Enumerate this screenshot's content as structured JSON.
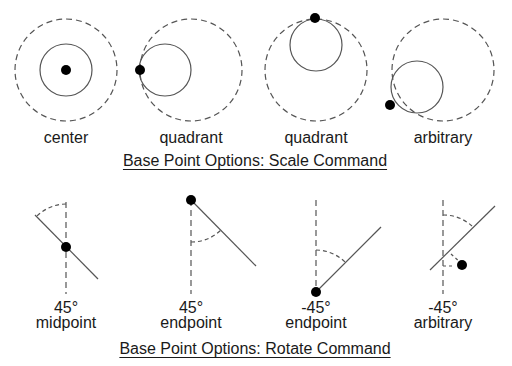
{
  "scale_section": {
    "caption": "Base Point Options: Scale Command",
    "items": [
      {
        "label": "center"
      },
      {
        "label": "quadrant"
      },
      {
        "label": "quadrant"
      },
      {
        "label": "arbitrary"
      }
    ]
  },
  "rotate_section": {
    "caption": "Base Point Options: Rotate Command",
    "items": [
      {
        "angle": "45°",
        "label": "midpoint"
      },
      {
        "angle": "45°",
        "label": "endpoint"
      },
      {
        "angle": "-45°",
        "label": "endpoint"
      },
      {
        "angle": "-45°",
        "label": "arbitrary"
      }
    ]
  },
  "colors": {
    "stroke": "#444444",
    "point": "#000000",
    "background": "#ffffff"
  }
}
